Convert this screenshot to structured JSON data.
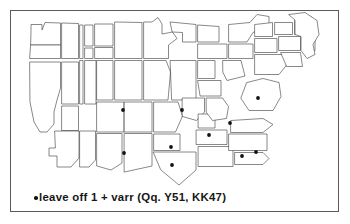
{
  "figure": {
    "kind": "dot-distribution-map",
    "region": "continental-united-states",
    "frame": {
      "x": 10,
      "y": 10,
      "width": 329,
      "height": 202
    },
    "colors": {
      "outline": "#3f3f3f",
      "frame": "#5a5a5a",
      "dot": "#121212",
      "background": "#ffffff",
      "text": "#161616"
    }
  },
  "caption": {
    "bullet_icon": "dot-icon",
    "text": "leave off 1 + varr  (Qq. Y51, KK47)",
    "phrase": "leave off 1 + varr",
    "reference": "(Qq. Y51, KK47)"
  },
  "chart_data": {
    "type": "scatter",
    "title": "leave off 1 + varr (Qq. Y51, KK47)",
    "xlabel": "",
    "ylabel": "",
    "grid": false,
    "legend": "none",
    "marker_count": 10,
    "markers": [
      {
        "x": 123,
        "y": 110
      },
      {
        "x": 182,
        "y": 110
      },
      {
        "x": 258,
        "y": 98
      },
      {
        "x": 230,
        "y": 123
      },
      {
        "x": 209,
        "y": 135
      },
      {
        "x": 124,
        "y": 153
      },
      {
        "x": 171,
        "y": 147
      },
      {
        "x": 172,
        "y": 165
      },
      {
        "x": 242,
        "y": 156
      },
      {
        "x": 256,
        "y": 152
      }
    ]
  },
  "map": {
    "outline_paths": [
      "M 31 31 L 31 24 L 42 24 L 42 31 L 44 22 L 60 23 L 60 45 L 31 45 Z",
      "M 31 45 L 60 45 L 60 58 L 31 58 Z",
      "M 29 62 L 60 62 L 60 86 L 59 100 L 52 112 L 52 124 L 45 130 L 38 130 L 33 120 L 29 100 Z",
      "M 62 23 L 78 23 L 78 58 L 62 58 Z",
      "M 62 62 L 78 62 L 78 104 L 62 104 Z",
      "M 62 106 L 78 106 L 78 130 L 62 130 Z",
      "M 80 25 L 82 25 L 82 58 L 80 58 Z",
      "M 80 60 L 82 60 L 82 104 L 80 104 Z",
      "M 84 25 L 92 25 L 92 46 L 84 46 Z",
      "M 84 48 L 92 48 L 92 58 L 84 58 Z",
      "M 84 60 L 95 60 L 95 104 L 84 104 Z",
      "M 53 131 L 78 131 L 78 158 L 70 166 L 56 166 L 56 155 L 48 155 L 48 147 L 53 147 Z",
      "M 79 131 L 95 131 L 95 160 L 88 166 L 79 166 Z",
      "M 94 24 L 112 24 L 112 46 L 94 46 Z",
      "M 94 47 L 112 47 L 112 58 L 94 58 Z",
      "M 96 60 L 112 60 L 112 100 L 96 100 Z",
      "M 96 102 L 124 102 L 124 132 L 96 132 Z",
      "M 96 133 L 122 133 L 122 163 L 110 170 L 96 166 Z",
      "M 114 22 L 142 22 L 142 58 L 114 58 Z",
      "M 114 60 L 142 60 L 142 100 L 114 100 Z",
      "M 124 102 L 152 102 L 152 132 L 124 132 Z",
      "M 124 133 L 152 133 L 152 166 L 124 172 Z",
      "M 144 22 L 152 22 L 158 18 L 162 24 L 162 34 L 172 32 L 176 38 L 168 44 L 168 58 L 144 58 Z",
      "M 144 60 L 166 60 L 170 72 L 168 100 L 144 100 Z",
      "M 154 102 L 178 102 L 182 116 L 175 132 L 154 132 Z",
      "M 154 134 L 180 134 L 180 150 L 154 150 Z",
      "M 153 152 L 196 152 L 196 170 L 178 184 L 160 170 Z",
      "M 170 22 L 196 24 L 196 42 L 182 42 L 182 32 L 172 32 Z",
      "M 170 60 L 196 60 L 196 100 L 172 100 Z",
      "M 198 24 L 218 26 L 218 42 L 198 42 Z",
      "M 198 44 L 226 44 L 226 58 L 198 58 Z",
      "M 198 60 L 214 60 L 214 78 L 198 78 Z",
      "M 198 80 L 220 80 L 220 96 L 200 96 Z",
      "M 182 98 L 204 98 L 204 112 L 196 120 L 182 116 Z",
      "M 198 114 L 214 114 L 214 128 L 198 128 Z",
      "M 196 130 L 226 130 L 226 144 L 196 144 Z",
      "M 198 146 L 232 146 L 232 166 L 198 166 Z",
      "M 206 98 L 222 98 L 228 106 L 226 118 L 212 120 L 206 112 Z",
      "M 222 60 L 240 60 L 244 76 L 226 80 L 222 72 Z",
      "M 228 24 L 250 22 L 256 14 L 268 16 L 268 26 L 252 32 L 246 42 L 228 42 Z",
      "M 228 44 L 252 44 L 252 58 L 228 58 Z",
      "M 246 82 L 262 78 L 278 82 L 280 96 L 272 110 L 248 110 L 240 98 Z",
      "M 230 120 L 262 118 L 272 124 L 262 132 L 230 132 Z",
      "M 228 134 L 266 134 L 266 150 L 228 150 Z",
      "M 234 152 L 262 152 L 268 158 L 262 164 L 234 164 Z",
      "M 254 24 L 272 22 L 272 36 L 254 36 Z",
      "M 254 38 L 276 38 L 276 52 L 254 52 Z",
      "M 254 54 L 282 54 L 286 64 L 278 74 L 254 74 Z",
      "M 274 22 L 292 22 L 292 34 L 274 34 Z",
      "M 278 36 L 300 36 L 300 50 L 278 50 Z",
      "M 280 52 L 300 52 L 302 66 L 286 66 Z",
      "M 294 18 L 310 16 L 314 24 L 306 34 L 294 34 Z",
      "M 302 36 L 314 36 L 314 50 L 302 50 Z",
      "M 288 14 L 304 12 L 316 20 L 318 34 L 312 44 L 314 54 L 306 58 L 300 50 L 300 36 L 294 34 L 294 20 Z"
    ],
    "has_state_boundaries": true,
    "state_count_drawn": 48
  }
}
